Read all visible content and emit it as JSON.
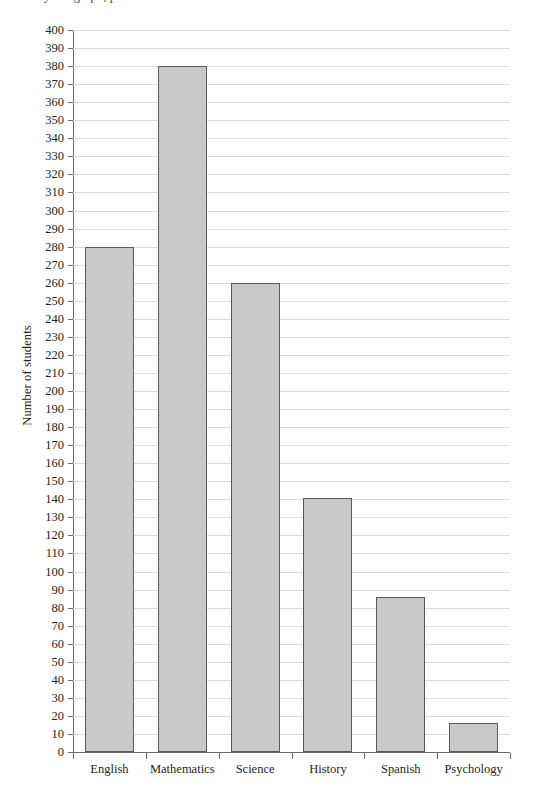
{
  "clipped_header_text": "y bar graph, plotted with values shown",
  "chart_data": {
    "type": "bar",
    "title": "",
    "xlabel": "",
    "ylabel": "Number of students",
    "categories": [
      "English",
      "Mathematics",
      "Science",
      "History",
      "Spanish",
      "Psychology"
    ],
    "values": [
      280,
      380,
      260,
      141,
      86,
      16
    ],
    "ylim": [
      0,
      400
    ],
    "ytick_step": 10,
    "yticks": [
      0,
      10,
      20,
      30,
      40,
      50,
      60,
      70,
      80,
      90,
      100,
      110,
      120,
      130,
      140,
      150,
      160,
      170,
      180,
      190,
      200,
      210,
      220,
      230,
      240,
      250,
      260,
      270,
      280,
      290,
      300,
      310,
      320,
      330,
      340,
      350,
      360,
      370,
      380,
      390,
      400
    ],
    "grid": true,
    "grid_orientation": "horizontal",
    "legend": false,
    "bar_fill_color": "#c9c9c9",
    "bar_border_color": "#5a5a5a",
    "gridline_color": "#dcdcdc",
    "axis_color": "#6b6b6b",
    "background_color": "#ffffff"
  }
}
